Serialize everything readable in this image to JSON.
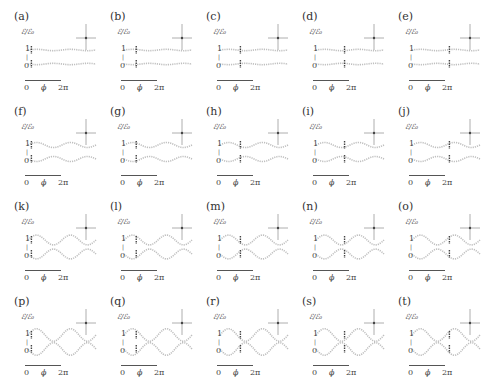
{
  "figure": {
    "layout": {
      "rows": 4,
      "cols": 5
    },
    "axis": {
      "ylabel": "ℰ/ℰ₀",
      "yticks": [
        "1",
        "0"
      ],
      "ytick_mid": "|",
      "xticks": [
        "0",
        "ϕ",
        "2π"
      ]
    },
    "panels": [
      {
        "label": "(a)",
        "row": 0,
        "col": 0,
        "marker_x": 0.05
      },
      {
        "label": "(b)",
        "row": 0,
        "col": 1,
        "marker_x": 0.18
      },
      {
        "label": "(c)",
        "row": 0,
        "col": 2,
        "marker_x": 0.3
      },
      {
        "label": "(d)",
        "row": 0,
        "col": 3,
        "marker_x": 0.42
      },
      {
        "label": "(e)",
        "row": 0,
        "col": 4,
        "marker_x": 0.55
      },
      {
        "label": "(f)",
        "row": 1,
        "col": 0,
        "marker_x": 0.05
      },
      {
        "label": "(g)",
        "row": 1,
        "col": 1,
        "marker_x": 0.18
      },
      {
        "label": "(h)",
        "row": 1,
        "col": 2,
        "marker_x": 0.3
      },
      {
        "label": "(i)",
        "row": 1,
        "col": 3,
        "marker_x": 0.42
      },
      {
        "label": "(j)",
        "row": 1,
        "col": 4,
        "marker_x": 0.55
      },
      {
        "label": "(k)",
        "row": 2,
        "col": 0,
        "marker_x": 0.05
      },
      {
        "label": "(l)",
        "row": 2,
        "col": 1,
        "marker_x": 0.18
      },
      {
        "label": "(m)",
        "row": 2,
        "col": 2,
        "marker_x": 0.3
      },
      {
        "label": "(n)",
        "row": 2,
        "col": 3,
        "marker_x": 0.42
      },
      {
        "label": "(o)",
        "row": 2,
        "col": 4,
        "marker_x": 0.55
      },
      {
        "label": "(p)",
        "row": 3,
        "col": 0,
        "marker_x": 0.05
      },
      {
        "label": "(q)",
        "row": 3,
        "col": 1,
        "marker_x": 0.18
      },
      {
        "label": "(r)",
        "row": 3,
        "col": 2,
        "marker_x": 0.3
      },
      {
        "label": "(s)",
        "row": 3,
        "col": 3,
        "marker_x": 0.42
      },
      {
        "label": "(t)",
        "row": 3,
        "col": 4,
        "marker_x": 0.55
      }
    ]
  },
  "chart_data": {
    "type": "scatter",
    "title": "",
    "xlabel": "ϕ",
    "ylabel": "ℰ/ℰ₀",
    "xticks": [
      "0",
      "2π"
    ],
    "yticks": [
      "0",
      "1"
    ],
    "xlim": [
      0,
      "2π"
    ],
    "ylim": [
      0,
      1
    ],
    "grid": false,
    "legend": null,
    "panels": [
      "(a)",
      "(b)",
      "(c)",
      "(d)",
      "(e)",
      "(f)",
      "(g)",
      "(h)",
      "(i)",
      "(j)",
      "(k)",
      "(l)",
      "(m)",
      "(n)",
      "(o)",
      "(p)",
      "(q)",
      "(r)",
      "(s)",
      "(t)"
    ],
    "row_amplitude": [
      0.08,
      0.18,
      0.35,
      0.45
    ],
    "marker_x_fraction_by_col": [
      0.05,
      0.18,
      0.3,
      0.42,
      0.55
    ]
  }
}
